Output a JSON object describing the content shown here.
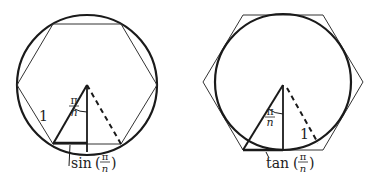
{
  "figures": [
    {
      "id": "inscribed",
      "description": "Regular hexagon inscribed in circle",
      "side_label": "1",
      "angle_label": {
        "num": "π",
        "den": "n"
      },
      "segment_label": {
        "func": "sin",
        "num": "π",
        "den": "n"
      }
    },
    {
      "id": "circumscribed",
      "description": "Regular hexagon circumscribed about circle",
      "radius_label": "1",
      "angle_label": {
        "num": "π",
        "den": "n"
      },
      "segment_label": {
        "func": "tan",
        "num": "π",
        "den": "n"
      }
    }
  ],
  "colors": {
    "stroke": "#1a1a1a",
    "thin": "#333333"
  }
}
